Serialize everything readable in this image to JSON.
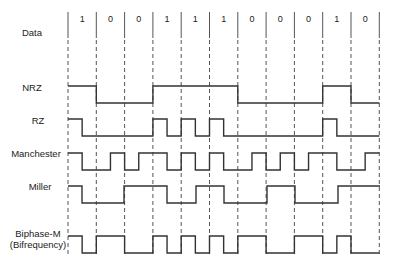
{
  "diagram": {
    "title": "",
    "bits": [
      "1",
      "0",
      "0",
      "1",
      "1",
      "1",
      "0",
      "0",
      "0",
      "1",
      "0"
    ],
    "row_labels": {
      "data": "Data",
      "nrz": "NRZ",
      "rz": "RZ",
      "manchester": "Manchester",
      "miller": "Miller",
      "biphase_m_line1": "Biphase-M",
      "biphase_m_line2": "(Bifrequency)"
    },
    "colors": {
      "line": "#333333",
      "grid": "#555555",
      "background": "#ffffff"
    },
    "signals": [
      {
        "name": "NRZ",
        "levels_per_half_bit": [
          "H",
          "H",
          "L",
          "L",
          "L",
          "L",
          "H",
          "H",
          "H",
          "H",
          "H",
          "H",
          "L",
          "L",
          "L",
          "L",
          "L",
          "L",
          "H",
          "H",
          "L",
          "L"
        ]
      },
      {
        "name": "RZ",
        "levels_per_half_bit": [
          "H",
          "L",
          "L",
          "L",
          "L",
          "L",
          "H",
          "L",
          "H",
          "L",
          "H",
          "L",
          "L",
          "L",
          "L",
          "L",
          "L",
          "L",
          "H",
          "L",
          "L",
          "L"
        ]
      },
      {
        "name": "Manchester",
        "levels_per_half_bit": [
          "H",
          "L",
          "L",
          "H",
          "L",
          "H",
          "H",
          "L",
          "H",
          "L",
          "H",
          "L",
          "L",
          "H",
          "L",
          "H",
          "L",
          "H",
          "H",
          "L",
          "L",
          "H"
        ]
      },
      {
        "name": "Miller",
        "levels_per_half_bit": [
          "H",
          "L",
          "L",
          "L",
          "L",
          "L",
          "H",
          "H",
          "H",
          "L",
          "L",
          "H",
          "H",
          "L",
          "L",
          "L",
          "H",
          "H",
          "L",
          "L",
          "L",
          "H",
          "H",
          "H"
        ]
      },
      {
        "name": "Biphase-M (Bifrequency)",
        "levels_per_half_bit": [
          "H",
          "L",
          "H",
          "H",
          "L",
          "L",
          "H",
          "L",
          "H",
          "L",
          "H",
          "L",
          "H",
          "H",
          "L",
          "L",
          "H",
          "H",
          "L",
          "H",
          "L",
          "L"
        ]
      }
    ]
  }
}
